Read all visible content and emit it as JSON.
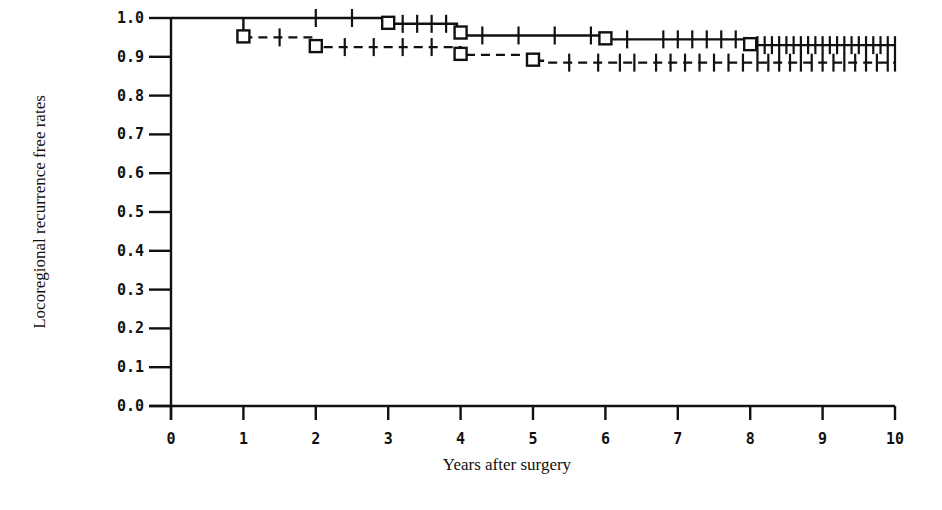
{
  "chart_data": {
    "type": "line",
    "subtype": "kaplan-meier step curve",
    "title": "",
    "xlabel": "Years after surgery",
    "ylabel": "Locoregional recurrence free rates",
    "xlim": [
      0,
      10
    ],
    "ylim": [
      0.0,
      1.0
    ],
    "x_ticks": [
      "0",
      "1",
      "2",
      "3",
      "4",
      "5",
      "6",
      "7",
      "8",
      "9",
      "10"
    ],
    "y_ticks": [
      "0.0",
      "0.1",
      "0.2",
      "0.3",
      "0.4",
      "0.5",
      "0.6",
      "0.7",
      "0.8",
      "0.9",
      "1.0"
    ],
    "grid": false,
    "legend": null,
    "series": [
      {
        "name": "solid curve",
        "style": "solid",
        "steps": [
          [
            0,
            1.0
          ],
          [
            3,
            0.985
          ],
          [
            3.95,
            0.96
          ],
          [
            4.05,
            0.955
          ],
          [
            5.95,
            0.945
          ],
          [
            7.95,
            0.93
          ],
          [
            10,
            0.93
          ]
        ],
        "event_markers": [
          [
            3,
            0.985
          ],
          [
            4,
            0.96
          ],
          [
            6,
            0.945
          ],
          [
            8,
            0.93
          ]
        ],
        "censor_marks": [
          2,
          2.5,
          3.2,
          3.4,
          3.6,
          3.8,
          4.3,
          4.8,
          5.3,
          5.8,
          6.3,
          6.8,
          7.0,
          7.2,
          7.4,
          7.6,
          7.8,
          8.1,
          8.2,
          8.3,
          8.4,
          8.5,
          8.6,
          8.7,
          8.8,
          8.9,
          9.0,
          9.1,
          9.2,
          9.3,
          9.4,
          9.5,
          9.6,
          9.7,
          9.8,
          9.9,
          10.0
        ]
      },
      {
        "name": "dashed curve",
        "style": "dashed",
        "steps": [
          [
            0,
            1.0
          ],
          [
            1,
            0.95
          ],
          [
            2,
            0.925
          ],
          [
            4,
            0.905
          ],
          [
            5,
            0.89
          ],
          [
            5.2,
            0.885
          ],
          [
            10,
            0.885
          ]
        ],
        "event_markers": [
          [
            1,
            0.95
          ],
          [
            2,
            0.925
          ],
          [
            4,
            0.905
          ],
          [
            5,
            0.89
          ]
        ],
        "censor_marks": [
          1.5,
          2.4,
          2.8,
          3.2,
          3.6,
          5.5,
          5.9,
          6.2,
          6.4,
          6.7,
          6.9,
          7.1,
          7.3,
          7.5,
          7.7,
          7.9,
          8.1,
          8.25,
          8.4,
          8.55,
          8.7,
          8.85,
          9.0,
          9.15,
          9.3,
          9.45,
          9.6,
          9.75,
          9.9,
          10.0
        ]
      }
    ]
  }
}
